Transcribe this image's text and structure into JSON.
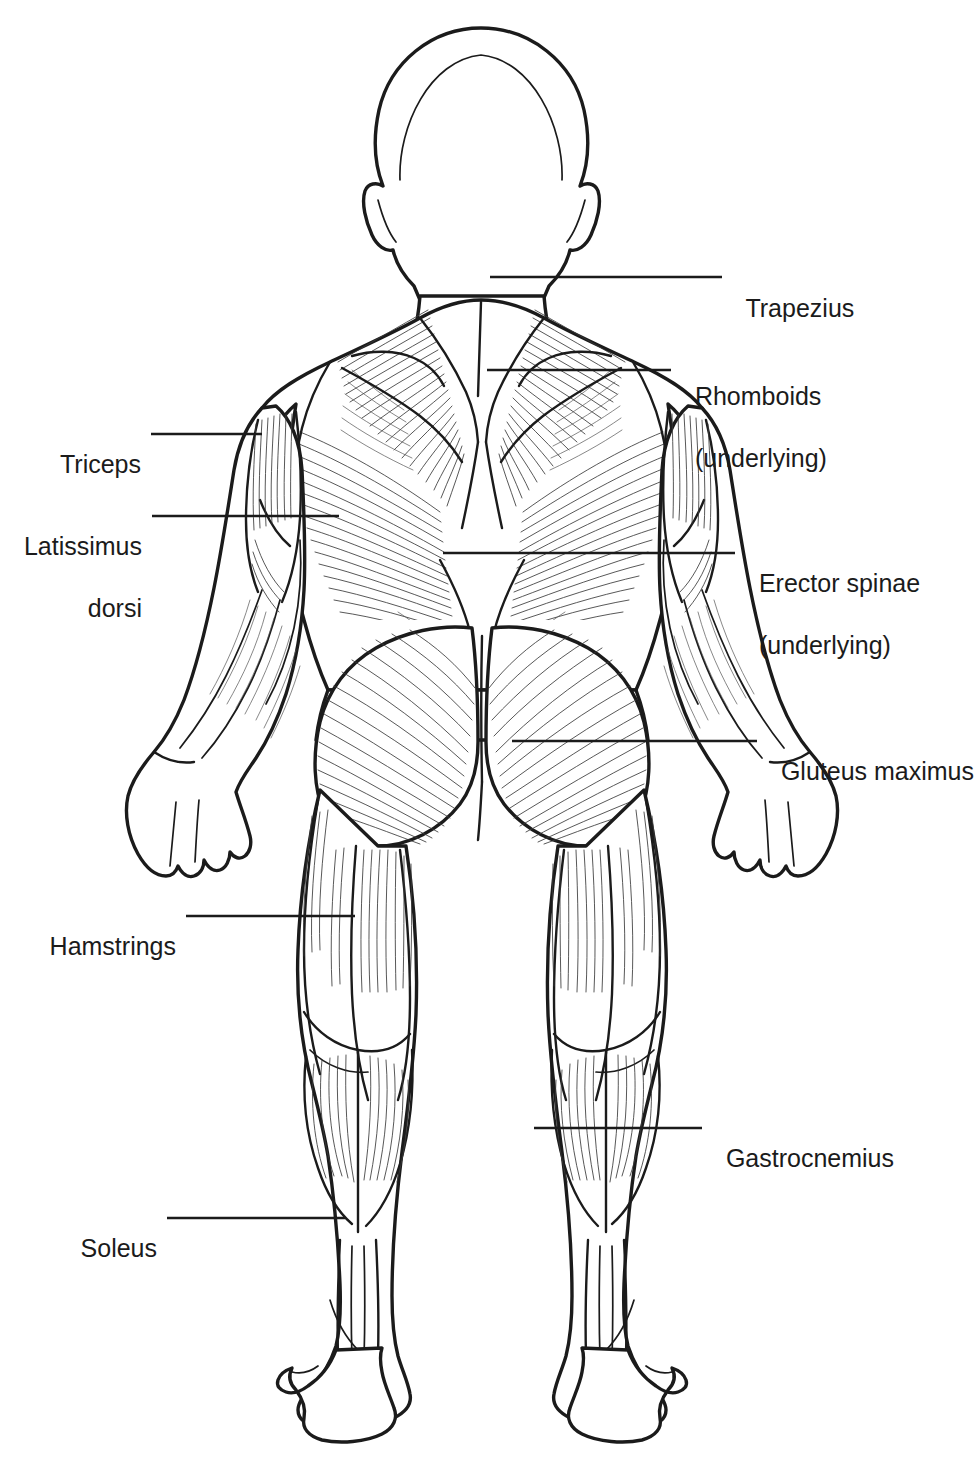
{
  "figure": {
    "view": "posterior",
    "line_color": "#1b1b1b",
    "fill_color": "#ffffff",
    "background": "#ffffff",
    "text_color": "#1b1b1b"
  },
  "labels": [
    {
      "id": "trapezius",
      "text": "Trapezius",
      "text2": "",
      "side": "right",
      "x": 732,
      "y": 262,
      "leader_from_x": 722,
      "leader_to_x": 490,
      "leader_y": 277
    },
    {
      "id": "rhomboids",
      "text": "Rhomboids",
      "text2": "(underlying)",
      "side": "right",
      "x": 681,
      "y": 350,
      "leader_from_x": 671,
      "leader_to_x": 487,
      "leader_y": 370
    },
    {
      "id": "erector-spinae",
      "text": "Erector spinae",
      "text2": "(underlying)",
      "side": "right",
      "x": 745,
      "y": 537,
      "leader_from_x": 735,
      "leader_to_x": 443,
      "leader_y": 553
    },
    {
      "id": "gluteus-maximus",
      "text": "Gluteus maximus",
      "text2": "",
      "side": "right",
      "x": 767,
      "y": 725,
      "leader_from_x": 757,
      "leader_to_x": 512,
      "leader_y": 741
    },
    {
      "id": "gastrocnemius",
      "text": "Gastrocnemius",
      "text2": "",
      "side": "right",
      "x": 712,
      "y": 1112,
      "leader_from_x": 702,
      "leader_to_x": 534,
      "leader_y": 1128
    },
    {
      "id": "triceps",
      "text": "Triceps",
      "text2": "",
      "side": "left",
      "x": 61,
      "y": 418,
      "leader_from_x": 151,
      "leader_to_x": 262,
      "leader_y": 434
    },
    {
      "id": "latissimus-dorsi",
      "text": "Latissimus",
      "text2": "dorsi",
      "side": "left",
      "x": 27,
      "y": 500,
      "leader_from_x": 152,
      "leader_to_x": 339,
      "leader_y": 516
    },
    {
      "id": "hamstrings",
      "text": "Hamstrings",
      "text2": "",
      "side": "left",
      "x": 58,
      "y": 900,
      "leader_from_x": 186,
      "leader_to_x": 355,
      "leader_y": 916
    },
    {
      "id": "soleus",
      "text": "Soleus",
      "text2": "",
      "side": "left",
      "x": 92,
      "y": 1202,
      "leader_from_x": 167,
      "leader_to_x": 345,
      "leader_y": 1218
    }
  ]
}
